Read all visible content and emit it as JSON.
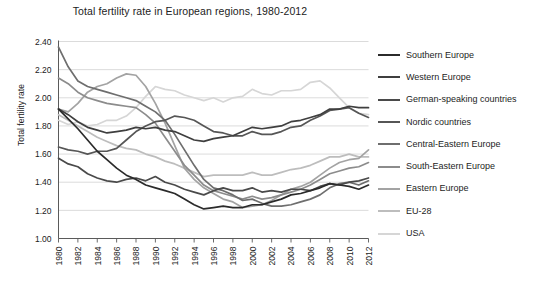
{
  "chart_data": {
    "type": "line",
    "title": "Total fertility rate in European regions, 1980-2012",
    "xlabel": "",
    "ylabel": "Total fertility rate",
    "ylim": [
      1.0,
      2.4
    ],
    "xlim": [
      1980,
      2012
    ],
    "yticks": [
      "1.00",
      "1.20",
      "1.40",
      "1.60",
      "1.80",
      "2.00",
      "2.20",
      "2.40"
    ],
    "xticks": [
      "1980",
      "1982",
      "1984",
      "1986",
      "1988",
      "1990",
      "1992",
      "1994",
      "1996",
      "1998",
      "2000",
      "2002",
      "2004",
      "2006",
      "2008",
      "2010",
      "2012"
    ],
    "grid": true,
    "legend_position": "right",
    "x": [
      1980,
      1981,
      1982,
      1983,
      1984,
      1985,
      1986,
      1987,
      1988,
      1989,
      1990,
      1991,
      1992,
      1993,
      1994,
      1995,
      1996,
      1997,
      1998,
      1999,
      2000,
      2001,
      2002,
      2003,
      2004,
      2005,
      2006,
      2007,
      2008,
      2009,
      2010,
      2011,
      2012
    ],
    "series": [
      {
        "name": "Southern Europe",
        "color": "#2b2b2b",
        "values": [
          1.92,
          1.85,
          1.78,
          1.7,
          1.62,
          1.56,
          1.5,
          1.45,
          1.42,
          1.38,
          1.36,
          1.34,
          1.32,
          1.28,
          1.24,
          1.21,
          1.22,
          1.23,
          1.22,
          1.22,
          1.24,
          1.24,
          1.26,
          1.28,
          1.31,
          1.32,
          1.34,
          1.36,
          1.39,
          1.38,
          1.37,
          1.35,
          1.38
        ]
      },
      {
        "name": "Western Europe",
        "color": "#3f3f3f",
        "values": [
          1.92,
          1.88,
          1.83,
          1.79,
          1.77,
          1.75,
          1.76,
          1.77,
          1.79,
          1.78,
          1.79,
          1.77,
          1.76,
          1.73,
          1.7,
          1.69,
          1.71,
          1.72,
          1.73,
          1.76,
          1.79,
          1.78,
          1.79,
          1.8,
          1.83,
          1.84,
          1.86,
          1.88,
          1.92,
          1.92,
          1.94,
          1.93,
          1.93
        ]
      },
      {
        "name": "German-speaking countries",
        "color": "#4a4a4a",
        "values": [
          1.57,
          1.53,
          1.51,
          1.46,
          1.43,
          1.41,
          1.4,
          1.42,
          1.43,
          1.41,
          1.44,
          1.4,
          1.38,
          1.35,
          1.33,
          1.31,
          1.34,
          1.36,
          1.34,
          1.34,
          1.36,
          1.33,
          1.34,
          1.33,
          1.35,
          1.35,
          1.34,
          1.37,
          1.39,
          1.38,
          1.4,
          1.41,
          1.43
        ]
      },
      {
        "name": "Nordic countries",
        "color": "#565656",
        "values": [
          1.65,
          1.63,
          1.62,
          1.6,
          1.62,
          1.62,
          1.64,
          1.7,
          1.76,
          1.8,
          1.83,
          1.84,
          1.87,
          1.86,
          1.84,
          1.8,
          1.76,
          1.75,
          1.73,
          1.73,
          1.76,
          1.74,
          1.74,
          1.76,
          1.79,
          1.8,
          1.84,
          1.87,
          1.91,
          1.92,
          1.93,
          1.89,
          1.86
        ]
      },
      {
        "name": "Central-Eastern Europe",
        "color": "#6e6e6e",
        "values": [
          2.36,
          2.22,
          2.12,
          2.08,
          2.06,
          2.04,
          2.02,
          2.0,
          1.98,
          1.94,
          1.9,
          1.84,
          1.74,
          1.63,
          1.52,
          1.42,
          1.36,
          1.34,
          1.31,
          1.27,
          1.28,
          1.25,
          1.23,
          1.23,
          1.24,
          1.26,
          1.28,
          1.31,
          1.36,
          1.39,
          1.4,
          1.38,
          1.41
        ]
      },
      {
        "name": "South-Eastern Europe",
        "color": "#8c8c8c",
        "values": [
          2.14,
          2.1,
          2.04,
          2.0,
          1.98,
          1.96,
          1.95,
          1.94,
          1.93,
          1.88,
          1.82,
          1.72,
          1.62,
          1.52,
          1.45,
          1.38,
          1.34,
          1.32,
          1.3,
          1.28,
          1.3,
          1.28,
          1.29,
          1.31,
          1.33,
          1.35,
          1.38,
          1.42,
          1.46,
          1.48,
          1.5,
          1.51,
          1.54
        ]
      },
      {
        "name": "Eastern Europe",
        "color": "#a3a3a3",
        "values": [
          1.92,
          1.9,
          1.96,
          2.04,
          2.08,
          2.1,
          2.14,
          2.17,
          2.16,
          2.08,
          1.96,
          1.82,
          1.66,
          1.5,
          1.42,
          1.36,
          1.32,
          1.28,
          1.26,
          1.22,
          1.23,
          1.24,
          1.27,
          1.31,
          1.35,
          1.37,
          1.4,
          1.45,
          1.5,
          1.54,
          1.56,
          1.57,
          1.63
        ]
      },
      {
        "name": "EU-28",
        "color": "#bdbdbd",
        "values": [
          1.88,
          1.84,
          1.8,
          1.76,
          1.72,
          1.69,
          1.66,
          1.64,
          1.63,
          1.6,
          1.58,
          1.55,
          1.53,
          1.5,
          1.47,
          1.44,
          1.45,
          1.45,
          1.45,
          1.45,
          1.47,
          1.45,
          1.45,
          1.47,
          1.49,
          1.5,
          1.52,
          1.55,
          1.58,
          1.58,
          1.6,
          1.58,
          1.58
        ]
      },
      {
        "name": "USA",
        "color": "#d6d6d6",
        "values": [
          1.84,
          1.81,
          1.83,
          1.8,
          1.81,
          1.84,
          1.84,
          1.87,
          1.93,
          2.01,
          2.08,
          2.06,
          2.05,
          2.02,
          2.0,
          1.98,
          2.0,
          1.97,
          2.0,
          2.01,
          2.06,
          2.03,
          2.02,
          2.05,
          2.05,
          2.06,
          2.11,
          2.12,
          2.07,
          2.0,
          1.93,
          1.89,
          1.88
        ]
      }
    ]
  },
  "legend": {
    "items": [
      {
        "label": "Southern Europe"
      },
      {
        "label": "Western Europe"
      },
      {
        "label": "German-speaking countries"
      },
      {
        "label": "Nordic countries"
      },
      {
        "label": "Central-Eastern Europe"
      },
      {
        "label": "South-Eastern Europe"
      },
      {
        "label": "Eastern Europe"
      },
      {
        "label": "EU-28"
      },
      {
        "label": "USA"
      }
    ]
  }
}
